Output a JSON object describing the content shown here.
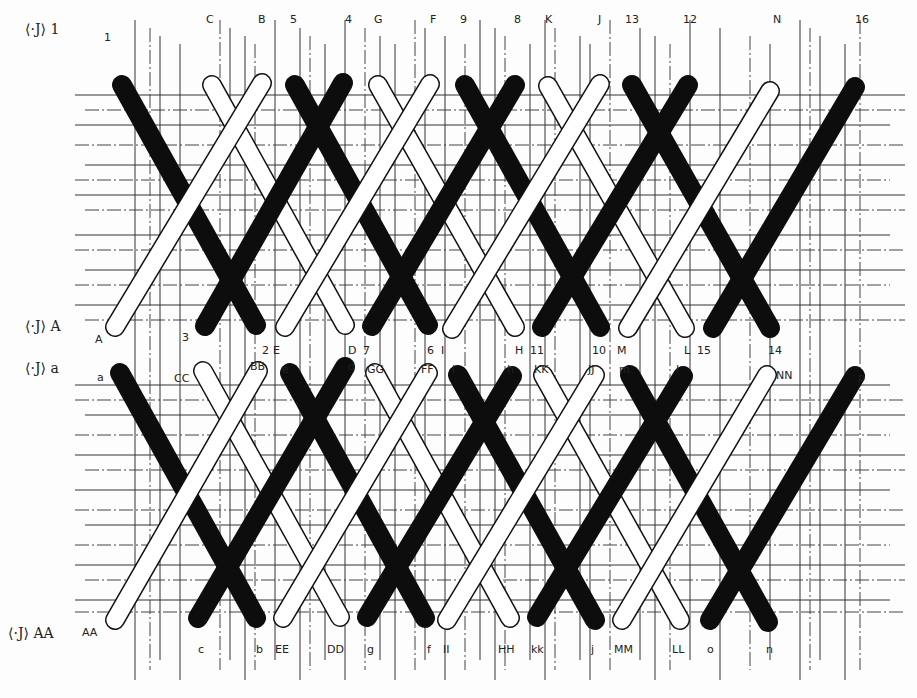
{
  "diagram": {
    "type": "cane-weaving-pattern",
    "colors": {
      "dark_strand": "#0d0d0d",
      "light_strand": "#ffffff",
      "outline": "#111111",
      "grid": "#333333",
      "background": "#fdfdfd"
    },
    "strand_width": 20,
    "row_markers": [
      {
        "id": "row-1",
        "text": "1",
        "x": 25,
        "y": 34
      },
      {
        "id": "row-A",
        "text": "A",
        "x": 25,
        "y": 331
      },
      {
        "id": "row-a",
        "text": "a",
        "x": 25,
        "y": 373
      },
      {
        "id": "row-AA",
        "text": "AA",
        "x": 8,
        "y": 638
      }
    ],
    "row_marker_symbol": "⟨·J⟩",
    "labels": [
      {
        "text": "1",
        "x": 104,
        "y": 30
      },
      {
        "text": "C",
        "x": 206,
        "y": 12
      },
      {
        "text": "B",
        "x": 258,
        "y": 12
      },
      {
        "text": "5",
        "x": 290,
        "y": 12
      },
      {
        "text": "4",
        "x": 345,
        "y": 12
      },
      {
        "text": "G",
        "x": 374,
        "y": 12
      },
      {
        "text": "F",
        "x": 430,
        "y": 12
      },
      {
        "text": "9",
        "x": 460,
        "y": 12
      },
      {
        "text": "8",
        "x": 514,
        "y": 12
      },
      {
        "text": "K",
        "x": 545,
        "y": 12
      },
      {
        "text": "J",
        "x": 598,
        "y": 12
      },
      {
        "text": "13",
        "x": 625,
        "y": 12
      },
      {
        "text": "12",
        "x": 683,
        "y": 12
      },
      {
        "text": "N",
        "x": 773,
        "y": 12
      },
      {
        "text": "16",
        "x": 855,
        "y": 12
      },
      {
        "text": "A",
        "x": 95,
        "y": 332
      },
      {
        "text": "3",
        "x": 182,
        "y": 330
      },
      {
        "text": "2",
        "x": 262,
        "y": 343
      },
      {
        "text": "E",
        "x": 273,
        "y": 343
      },
      {
        "text": "D",
        "x": 348,
        "y": 343
      },
      {
        "text": "7",
        "x": 363,
        "y": 343
      },
      {
        "text": "6",
        "x": 427,
        "y": 343
      },
      {
        "text": "I",
        "x": 441,
        "y": 343
      },
      {
        "text": "H",
        "x": 515,
        "y": 343
      },
      {
        "text": "11",
        "x": 530,
        "y": 343
      },
      {
        "text": "10",
        "x": 592,
        "y": 343
      },
      {
        "text": "M",
        "x": 617,
        "y": 343
      },
      {
        "text": "L",
        "x": 684,
        "y": 343
      },
      {
        "text": "15",
        "x": 697,
        "y": 343
      },
      {
        "text": "14",
        "x": 768,
        "y": 343
      },
      {
        "text": "a",
        "x": 97,
        "y": 370
      },
      {
        "text": "CC",
        "x": 174,
        "y": 371
      },
      {
        "text": "BB",
        "x": 250,
        "y": 359
      },
      {
        "text": "e",
        "x": 282,
        "y": 362
      },
      {
        "text": "d",
        "x": 348,
        "y": 359
      },
      {
        "text": "GG",
        "x": 367,
        "y": 362
      },
      {
        "text": "FF",
        "x": 421,
        "y": 362
      },
      {
        "text": "i",
        "x": 452,
        "y": 362
      },
      {
        "text": "h",
        "x": 507,
        "y": 362
      },
      {
        "text": "KK",
        "x": 534,
        "y": 362
      },
      {
        "text": "JJ",
        "x": 588,
        "y": 362
      },
      {
        "text": "m",
        "x": 619,
        "y": 362
      },
      {
        "text": "l",
        "x": 676,
        "y": 362
      },
      {
        "text": "NN",
        "x": 776,
        "y": 368
      },
      {
        "text": "p",
        "x": 858,
        "y": 370
      },
      {
        "text": "AA",
        "x": 82,
        "y": 625
      },
      {
        "text": "c",
        "x": 198,
        "y": 642
      },
      {
        "text": "b",
        "x": 256,
        "y": 642
      },
      {
        "text": "EE",
        "x": 275,
        "y": 642
      },
      {
        "text": "DD",
        "x": 327,
        "y": 642
      },
      {
        "text": "g",
        "x": 367,
        "y": 642
      },
      {
        "text": "f",
        "x": 427,
        "y": 642
      },
      {
        "text": "II",
        "x": 443,
        "y": 642
      },
      {
        "text": "HH",
        "x": 498,
        "y": 642
      },
      {
        "text": "kk",
        "x": 531,
        "y": 642
      },
      {
        "text": "j",
        "x": 591,
        "y": 642
      },
      {
        "text": "MM",
        "x": 614,
        "y": 642
      },
      {
        "text": "LL",
        "x": 672,
        "y": 642
      },
      {
        "text": "o",
        "x": 707,
        "y": 642
      },
      {
        "text": "n",
        "x": 766,
        "y": 642
      }
    ],
    "strands_top": [
      {
        "id": "dark-1-2",
        "color": "dark",
        "x1": 122,
        "y1": 85,
        "x2": 256,
        "y2": 325
      },
      {
        "id": "dark-5-6",
        "color": "dark",
        "x1": 295,
        "y1": 85,
        "x2": 428,
        "y2": 325
      },
      {
        "id": "dark-9-10",
        "color": "dark",
        "x1": 465,
        "y1": 85,
        "x2": 600,
        "y2": 327
      },
      {
        "id": "dark-13-14",
        "color": "dark",
        "x1": 632,
        "y1": 85,
        "x2": 770,
        "y2": 328
      },
      {
        "id": "light-C-D",
        "color": "light",
        "x1": 212,
        "y1": 85,
        "x2": 345,
        "y2": 325
      },
      {
        "id": "light-G-H",
        "color": "light",
        "x1": 378,
        "y1": 85,
        "x2": 515,
        "y2": 327
      },
      {
        "id": "light-K-L",
        "color": "light",
        "x1": 548,
        "y1": 86,
        "x2": 685,
        "y2": 328
      },
      {
        "id": "dark-4-3",
        "color": "dark",
        "x1": 343,
        "y1": 83,
        "x2": 205,
        "y2": 326
      },
      {
        "id": "dark-8-7",
        "color": "dark",
        "x1": 515,
        "y1": 85,
        "x2": 372,
        "y2": 326
      },
      {
        "id": "dark-12-11",
        "color": "dark",
        "x1": 688,
        "y1": 85,
        "x2": 542,
        "y2": 327
      },
      {
        "id": "dark-16-15",
        "color": "dark",
        "x1": 855,
        "y1": 87,
        "x2": 713,
        "y2": 328
      },
      {
        "id": "light-B-A",
        "color": "light",
        "x1": 262,
        "y1": 83,
        "x2": 115,
        "y2": 327
      },
      {
        "id": "light-F-E",
        "color": "light",
        "x1": 430,
        "y1": 84,
        "x2": 285,
        "y2": 327
      },
      {
        "id": "light-J-I",
        "color": "light",
        "x1": 600,
        "y1": 84,
        "x2": 452,
        "y2": 329
      },
      {
        "id": "light-N-M",
        "color": "light",
        "x1": 770,
        "y1": 91,
        "x2": 628,
        "y2": 328
      }
    ],
    "strands_bottom": [
      {
        "id": "dark-a-b",
        "color": "dark",
        "x1": 120,
        "y1": 373,
        "x2": 256,
        "y2": 618
      },
      {
        "id": "dark-e-f",
        "color": "dark",
        "x1": 290,
        "y1": 373,
        "x2": 425,
        "y2": 618
      },
      {
        "id": "dark-i-j",
        "color": "dark",
        "x1": 458,
        "y1": 375,
        "x2": 595,
        "y2": 620
      },
      {
        "id": "dark-m-n",
        "color": "dark",
        "x1": 630,
        "y1": 375,
        "x2": 768,
        "y2": 622
      },
      {
        "id": "light-CC-DD",
        "color": "light",
        "x1": 203,
        "y1": 371,
        "x2": 340,
        "y2": 617
      },
      {
        "id": "light-GG-HH",
        "color": "light",
        "x1": 375,
        "y1": 373,
        "x2": 510,
        "y2": 618
      },
      {
        "id": "light-KK-LL",
        "color": "light",
        "x1": 543,
        "y1": 375,
        "x2": 680,
        "y2": 620
      },
      {
        "id": "dark-d-c",
        "color": "dark",
        "x1": 345,
        "y1": 367,
        "x2": 198,
        "y2": 618
      },
      {
        "id": "dark-h-g",
        "color": "dark",
        "x1": 512,
        "y1": 376,
        "x2": 367,
        "y2": 617
      },
      {
        "id": "dark-l-kk",
        "color": "dark",
        "x1": 683,
        "y1": 376,
        "x2": 537,
        "y2": 617
      },
      {
        "id": "dark-p-o",
        "color": "dark",
        "x1": 855,
        "y1": 376,
        "x2": 710,
        "y2": 620
      },
      {
        "id": "light-BB-AA",
        "color": "light",
        "x1": 258,
        "y1": 371,
        "x2": 115,
        "y2": 620
      },
      {
        "id": "light-FF-EE",
        "color": "light",
        "x1": 428,
        "y1": 373,
        "x2": 283,
        "y2": 618
      },
      {
        "id": "light-JJ-II",
        "color": "light",
        "x1": 595,
        "y1": 375,
        "x2": 447,
        "y2": 620
      },
      {
        "id": "light-NN-MM",
        "color": "light",
        "x1": 767,
        "y1": 375,
        "x2": 622,
        "y2": 620
      }
    ],
    "grid": {
      "vertical_x": [
        135,
        150,
        160,
        180,
        220,
        230,
        245,
        255,
        275,
        300,
        310,
        325,
        345,
        365,
        380,
        395,
        415,
        425,
        445,
        465,
        480,
        495,
        505,
        530,
        545,
        555,
        580,
        590,
        610,
        640,
        655,
        670,
        690,
        720,
        750,
        770,
        800,
        810,
        820,
        845,
        860
      ],
      "horizontal_y": [
        95,
        110,
        125,
        145,
        165,
        180,
        195,
        210,
        235,
        250,
        270,
        285,
        305,
        320,
        385,
        400,
        415,
        435,
        455,
        470,
        490,
        510,
        525,
        545,
        565,
        580,
        600,
        612
      ],
      "left": 75,
      "right": 905,
      "top": 20,
      "bottom": 680
    }
  }
}
